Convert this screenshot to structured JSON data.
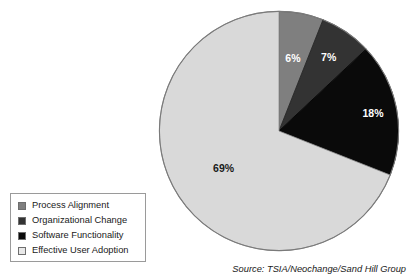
{
  "chart_data": {
    "type": "pie",
    "title": "",
    "subtitle": "",
    "xlabel": "",
    "ylabel": "",
    "legend_position": "bottom-left",
    "grid": false,
    "start_angle_deg": 0,
    "direction": "clockwise",
    "categories": [
      "Process Alignment",
      "Organizational Change",
      "Software Functionality",
      "Effective User Adoption"
    ],
    "values": [
      6,
      7,
      18,
      69
    ],
    "data_labels": [
      "6%",
      "7%",
      "18%",
      "69%"
    ],
    "colors": [
      "#7f7f7f",
      "#333333",
      "#0a0a0a",
      "#d9d9d9"
    ],
    "slices": [
      {
        "label": "Process Alignment",
        "value": 6,
        "display": "6%",
        "color": "#7f7f7f",
        "label_color": "#ffffff",
        "start_deg": 0,
        "end_deg": 21.6
      },
      {
        "label": "Organizational Change",
        "value": 7,
        "display": "7%",
        "color": "#333333",
        "label_color": "#ffffff",
        "start_deg": 21.6,
        "end_deg": 46.8
      },
      {
        "label": "Software Functionality",
        "value": 18,
        "display": "18%",
        "color": "#0a0a0a",
        "label_color": "#ffffff",
        "start_deg": 46.8,
        "end_deg": 111.6
      },
      {
        "label": "Effective User Adoption",
        "value": 69,
        "display": "69%",
        "color": "#d9d9d9",
        "label_color": "#1a1a1a",
        "start_deg": 111.6,
        "end_deg": 360
      }
    ],
    "total": 100,
    "units": "percent",
    "source": "Source: TSIA/Neochange/Sand Hill Group"
  },
  "legend": {
    "items": [
      {
        "label": "Process Alignment",
        "color": "#7f7f7f"
      },
      {
        "label": "Organizational Change",
        "color": "#333333"
      },
      {
        "label": "Software Functionality",
        "color": "#0a0a0a"
      },
      {
        "label": "Effective User Adoption",
        "color": "#e8e8e8"
      }
    ]
  },
  "footer": {
    "source": "Source: TSIA/Neochange/Sand Hill Group"
  }
}
